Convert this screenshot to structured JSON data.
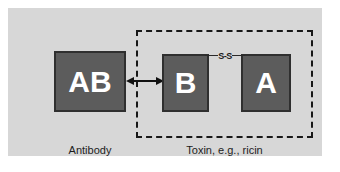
{
  "figure": {
    "background_color": "#d7d7d7",
    "page_color": "#ffffff",
    "box_fill_color": "#5c5c5c",
    "box_border_color": "#2f2f2f",
    "box_text_color": "#ffffff",
    "dashed_border_color": "#171717",
    "arrow_color": "#111111"
  },
  "antibody": {
    "box_label": "AB",
    "caption": "Antibody"
  },
  "toxin": {
    "caption": "Toxin, e.g., ricin",
    "b_chain": {
      "box_label": "B"
    },
    "a_chain": {
      "box_label": "A"
    },
    "disulfide_bond": {
      "label": "S-S"
    }
  },
  "interaction": {
    "arrow_type": "double-headed",
    "icons": {
      "binding_arrow": "double-arrow-icon",
      "disulfide": "disulfide-bond-icon"
    }
  }
}
